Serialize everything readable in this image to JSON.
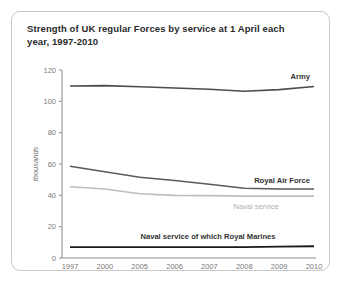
{
  "card": {
    "title": "Strength of UK regular Forces by service at 1 April each year, 1997-2010"
  },
  "chart_data": {
    "type": "line",
    "title": "Strength of UK regular Forces by service at 1 April each year, 1997-2010",
    "xlabel": "",
    "ylabel": "thousands",
    "ylim": [
      0,
      120
    ],
    "yticks": [
      0,
      20,
      40,
      60,
      80,
      100,
      120
    ],
    "ytick_labels": [
      "0",
      "20",
      "40",
      "60",
      "80",
      "100",
      "120"
    ],
    "categories": [
      "1997",
      "2000",
      "2005",
      "2006",
      "2007",
      "2008",
      "2009",
      "2010"
    ],
    "grid": false,
    "legend_position": "inline-end-labels",
    "series": [
      {
        "name": "Army",
        "label": "Army",
        "color": "#4d4d4d",
        "width": 1.6,
        "values": [
          109.8,
          110.0,
          109.3,
          108.5,
          107.7,
          106.4,
          107.5,
          109.5
        ]
      },
      {
        "name": "Royal Air Force",
        "label": "Royal Air Force",
        "color": "#5a5a5a",
        "width": 1.5,
        "values": [
          58.5,
          55.0,
          51.5,
          49.5,
          47.0,
          44.5,
          44.0,
          44.0
        ]
      },
      {
        "name": "Naval service",
        "label": "Naval service",
        "color": "#bdbdbd",
        "width": 1.6,
        "values": [
          45.5,
          44.0,
          41.0,
          40.0,
          39.8,
          39.5,
          39.5,
          39.5
        ]
      },
      {
        "name": "Naval service of which Royal Marines",
        "label": "Naval service of which Royal Marines",
        "color": "#1a1a1a",
        "width": 1.8,
        "values": [
          7.0,
          7.0,
          7.0,
          7.0,
          7.0,
          7.0,
          7.2,
          7.5
        ]
      }
    ]
  }
}
